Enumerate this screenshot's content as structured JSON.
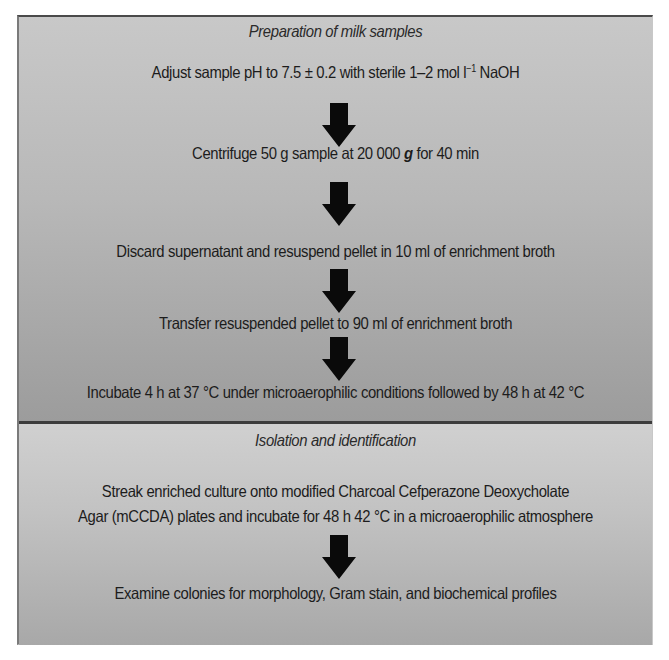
{
  "diagram": {
    "sections": [
      {
        "heading": "Preparation of milk samples",
        "steps": [
          {
            "text_a": "Adjust sample  pH to 7.5 ± 0.2 with sterile 1–2 mol l",
            "superscript": "−1",
            "text_b": " NaOH"
          },
          {
            "text_a": "Centrifuge 50 g sample at 20 000 ",
            "emphasis": "g",
            "text_b": " for 40 min"
          },
          {
            "text": "Discard supernatant and resuspend pellet in 10 ml of enrichment broth"
          },
          {
            "text": "Transfer resuspended pellet to 90 ml of enrichment broth"
          },
          {
            "text": "Incubate 4 h at 37 °C under microaerophilic conditions followed by 48 h at 42 °C"
          }
        ]
      },
      {
        "heading": "Isolation and identification",
        "steps": [
          {
            "line1": "Streak enriched culture onto modified Charcoal Cefperazone Deoxycholate",
            "line2": "Agar (mCCDA) plates and incubate for 48 h 42 °C in a microaerophilic atmosphere"
          },
          {
            "text": "Examine colonies for morphology, Gram stain, and biochemical profiles"
          }
        ]
      }
    ],
    "arrow_icon": "down-arrow-icon",
    "colors": {
      "section_top_start": "#c8c8c8",
      "section_top_end": "#9c9c9c",
      "section_bottom_start": "#d0d0d0",
      "section_bottom_end": "#a8a8a8",
      "divider": "#3c3c3c",
      "arrow": "#0a0a0a",
      "text": "#1c1c1c"
    }
  }
}
